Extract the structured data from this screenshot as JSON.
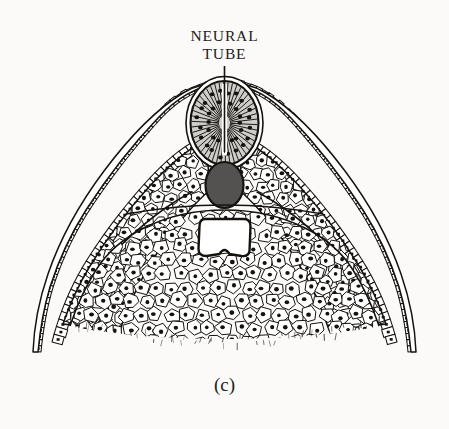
{
  "figure": {
    "domain": "biological-illustration",
    "title_lines": [
      "NEURAL",
      "TUBE"
    ],
    "caption": "(c)",
    "background_color": "#fbfaf8",
    "ink_color": "#15130f",
    "leader_line": {
      "name": "neural-tube-leader-line",
      "x": 224.5,
      "y_top": 66,
      "y_bottom": 152,
      "width": 1.6,
      "color": "#15130f"
    },
    "structures": [
      {
        "id": "ectoderm",
        "label": "outer ectoderm epithelium",
        "cell_shape": "small-rectangle",
        "fill": "#ffffff",
        "stroke": "#15130f"
      },
      {
        "id": "neural-tube",
        "label": "neural tube",
        "cell_shape": "radial-columnar",
        "fill": "#cfcdc9",
        "stroke": "#15130f",
        "center_x": 224.5,
        "center_y": 123,
        "radius_x": 34,
        "radius_y": 42,
        "lumen_color": "#ffffff"
      },
      {
        "id": "notochord",
        "label": "notochord",
        "fill": "#545250",
        "stroke": "#15130f",
        "center_x": 224.5,
        "center_y": 185,
        "radius_x": 19,
        "radius_y": 23
      },
      {
        "id": "gut-cavity",
        "label": "gut cavity / archenteron",
        "fill": "#ffffff",
        "stroke": "#15130f",
        "center_x": 224.5,
        "center_y": 237,
        "width": 48,
        "height": 36
      },
      {
        "id": "somite-left",
        "label": "left somite mass",
        "cell_shape": "polygonal",
        "fill": "#ffffff",
        "stroke": "#15130f"
      },
      {
        "id": "somite-right",
        "label": "right somite mass",
        "cell_shape": "polygonal",
        "fill": "#ffffff",
        "stroke": "#15130f"
      },
      {
        "id": "mesenchyme",
        "label": "ventral mesenchyme mass",
        "cell_shape": "polygonal",
        "fill": "#ffffff",
        "stroke": "#15130f"
      }
    ],
    "nucleus": {
      "color": "#15130f",
      "radius": 1.9
    }
  }
}
